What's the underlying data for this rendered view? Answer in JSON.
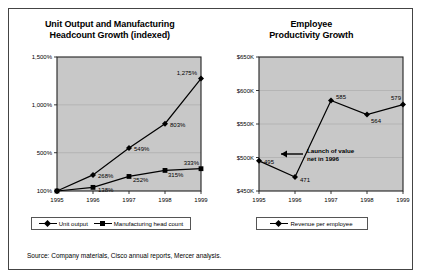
{
  "source_note": "Source:  Company materials, Cisco annual reports, Mercer analysis.",
  "colors": {
    "plot_background": "#c8c8c8",
    "line": "#000000",
    "frame": "#444444",
    "page": "#ffffff"
  },
  "chart_data": [
    {
      "type": "line",
      "title": "Unit Output and Manufacturing Headcount Growth (indexed)",
      "title_line1": "Unit Output and Manufacturing",
      "title_line2": "Headcount Growth (indexed)",
      "xlabel": "",
      "ylabel": "",
      "categories": [
        "1995",
        "1996",
        "1997",
        "1998",
        "1999"
      ],
      "ytick_labels": [
        "100%",
        "500%",
        "1,000%",
        "1,500%"
      ],
      "ytick_values": [
        100,
        500,
        1000,
        1500
      ],
      "ylim": [
        100,
        1500
      ],
      "grid": true,
      "legend_position": "bottom",
      "series": [
        {
          "name": "Unit output",
          "marker": "diamond",
          "values": [
            100,
            268,
            549,
            803,
            1275
          ],
          "labels": [
            "",
            "268%",
            "549%",
            "803%",
            "1,275%"
          ]
        },
        {
          "name": "Manufacturing head count",
          "marker": "square",
          "values": [
            100,
            138,
            252,
            315,
            333
          ],
          "labels": [
            "",
            "138%",
            "252%",
            "315%",
            "333%"
          ]
        }
      ]
    },
    {
      "type": "line",
      "title": "Employee Productivity Growth",
      "title_line1": "Employee",
      "title_line2": "Productivity Growth",
      "xlabel": "",
      "ylabel": "",
      "categories": [
        "1995",
        "1996",
        "1997",
        "1998",
        "1999"
      ],
      "ytick_labels": [
        "$450K",
        "$500K",
        "$550K",
        "$600K",
        "$650K"
      ],
      "ytick_values": [
        450,
        500,
        550,
        600,
        650
      ],
      "ylim": [
        450,
        650
      ],
      "grid": true,
      "legend_position": "bottom",
      "annotation": {
        "line1": "Launch of value",
        "line2": "net in 1996"
      },
      "series": [
        {
          "name": "Revenue per employee",
          "marker": "diamond",
          "values": [
            495,
            471,
            585,
            564,
            579
          ],
          "labels": [
            "495",
            "471",
            "585",
            "564",
            "579"
          ]
        }
      ]
    }
  ]
}
